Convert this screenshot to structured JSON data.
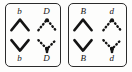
{
  "figure": {
    "panel_count": 2,
    "colors": {
      "ink": "#141414",
      "frame": "#2b2b2b",
      "background": "#fdfdfc"
    },
    "panels": [
      {
        "id": "panel-left",
        "cells": [
          {
            "id": "left-top-left",
            "label": "b",
            "label_position": "top",
            "glyph": "caret-up-solid",
            "stroke": "solid"
          },
          {
            "id": "left-top-right",
            "label": "D",
            "label_position": "top",
            "glyph": "caret-up-dotted",
            "stroke": "dotted"
          },
          {
            "id": "left-bottom-left",
            "label": "b",
            "label_position": "bottom",
            "glyph": "caret-down-solid",
            "stroke": "solid"
          },
          {
            "id": "left-bottom-right",
            "label": "D",
            "label_position": "bottom",
            "glyph": "caret-down-dotted",
            "stroke": "dotted"
          }
        ]
      },
      {
        "id": "panel-right",
        "cells": [
          {
            "id": "right-top-left",
            "label": "B",
            "label_position": "top",
            "glyph": "caret-up-solid",
            "stroke": "solid"
          },
          {
            "id": "right-top-right",
            "label": "d",
            "label_position": "top",
            "glyph": "caret-up-dotted",
            "stroke": "dotted"
          },
          {
            "id": "right-bottom-left",
            "label": "B",
            "label_position": "bottom",
            "glyph": "caret-down-solid",
            "stroke": "solid"
          },
          {
            "id": "right-bottom-right",
            "label": "d",
            "label_position": "bottom",
            "glyph": "caret-down-dotted",
            "stroke": "dotted"
          }
        ]
      }
    ]
  }
}
